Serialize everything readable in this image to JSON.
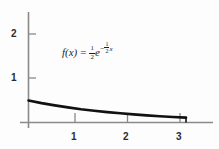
{
  "figure": {
    "background_color": "#fdfdfd",
    "axis_color": "#8a8a8a",
    "curve_color": "#111111",
    "text_color": "#2b2b2b"
  },
  "formula": {
    "function_name": "f(x)",
    "equals": "=",
    "coefficient_numerator": "1",
    "coefficient_denominator": "2",
    "base": "e",
    "exponent_sign": "−",
    "exponent_numerator": "1",
    "exponent_denominator": "2",
    "exponent_variable": "x",
    "plain_text": "f(x) = 1/2 e^(-1/2 x)"
  },
  "axes": {
    "x_ticks": [
      "1",
      "2",
      "3"
    ],
    "y_ticks": [
      "1",
      "2"
    ],
    "xlim": [
      0,
      3.5
    ],
    "ylim": [
      0,
      2.5
    ],
    "xlabel": "",
    "ylabel": ""
  },
  "chart_data": {
    "type": "line",
    "title": "",
    "xlabel": "",
    "ylabel": "",
    "xlim": [
      0,
      3.5
    ],
    "ylim": [
      0,
      2.5
    ],
    "grid": false,
    "legend": "none",
    "annotations": [
      "f(x) = 1/2 e^(-1/2 x)"
    ],
    "x_tick_values": [
      1,
      2,
      3
    ],
    "y_tick_values": [
      1,
      2
    ],
    "series": [
      {
        "name": "f(x) = 1/2 e^(-1/2 x)",
        "formula": "0.5*exp(-0.5*x)",
        "x": [
          0.0,
          0.25,
          0.5,
          0.75,
          1.0,
          1.25,
          1.5,
          1.75,
          2.0,
          2.25,
          2.5,
          2.75,
          3.0
        ],
        "y": [
          0.5,
          0.441,
          0.389,
          0.344,
          0.303,
          0.268,
          0.236,
          0.208,
          0.184,
          0.162,
          0.143,
          0.126,
          0.112
        ]
      }
    ]
  }
}
